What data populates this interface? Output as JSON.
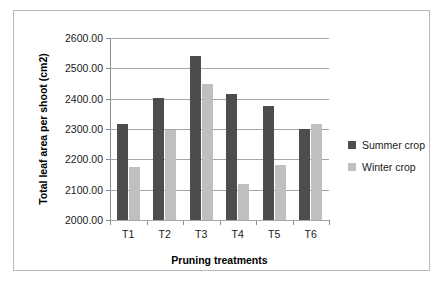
{
  "chart_data": {
    "type": "bar",
    "title": "",
    "xlabel": "Pruning treatments",
    "ylabel": "Total leaf area per shoot (cm2)",
    "categories": [
      "T1",
      "T2",
      "T3",
      "T4",
      "T5",
      "T6"
    ],
    "ylim": [
      2000,
      2600
    ],
    "ytick_labels": [
      "2600.00",
      "2500.00",
      "2400.00",
      "2300.00",
      "2200.00",
      "2100.00",
      "2000.00"
    ],
    "ytick_values": [
      2600,
      2500,
      2400,
      2300,
      2200,
      2100,
      2000
    ],
    "grid": true,
    "legend_position": "right",
    "series": [
      {
        "name": "Summer crop",
        "color": "#4d4d4d",
        "values": [
          2315,
          2403,
          2540,
          2415,
          2375,
          2300
        ]
      },
      {
        "name": "Winter crop",
        "color": "#bfbfbf",
        "values": [
          2175,
          2298,
          2450,
          2120,
          2180,
          2318
        ]
      }
    ]
  },
  "legend": {
    "items": [
      {
        "label": "Summer crop",
        "color": "#4d4d4d"
      },
      {
        "label": "Winter crop",
        "color": "#bfbfbf"
      }
    ]
  }
}
